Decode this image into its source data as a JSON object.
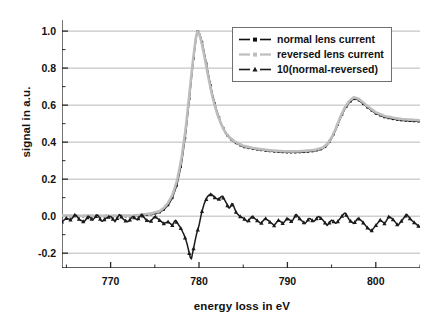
{
  "chart_data": {
    "type": "line",
    "title": "",
    "xlabel": "energy loss in eV",
    "ylabel": "signal in a.u.",
    "xlim": [
      764.5,
      805.0
    ],
    "ylim": [
      -0.28,
      1.06
    ],
    "xticks": [
      770,
      780,
      790,
      800
    ],
    "xticklabels": [
      "770",
      "780",
      "790",
      "800"
    ],
    "xminorticks": [
      765,
      775,
      785,
      795,
      805
    ],
    "yticks": [
      -0.2,
      0.0,
      0.2,
      0.4,
      0.6,
      0.8,
      1.0
    ],
    "yticklabels": [
      "-0.2",
      "0.0",
      "0.2",
      "0.4",
      "0.6",
      "0.8",
      "1.0"
    ],
    "grid": "horizontal",
    "grid_color": "#b8b8b8",
    "legend_position": "upper right",
    "series": [
      {
        "name": "normal lens current",
        "color": "#101010",
        "marker": "square",
        "linestyle": "dash-dot",
        "x": [
          764.5,
          765.5,
          766.5,
          767.5,
          768.5,
          769.5,
          770.5,
          771.5,
          772.5,
          773.5,
          774.5,
          775.5,
          776.0,
          776.5,
          777.0,
          777.5,
          778.0,
          778.5,
          779.0,
          779.3,
          779.6,
          779.8,
          780.0,
          780.3,
          780.6,
          781.0,
          781.5,
          782.0,
          782.5,
          783.0,
          783.5,
          784.0,
          785.0,
          786.0,
          787.0,
          788.0,
          789.0,
          790.0,
          791.0,
          792.0,
          793.0,
          794.0,
          794.5,
          795.0,
          795.5,
          796.0,
          796.5,
          797.0,
          797.5,
          798.0,
          798.5,
          799.0,
          800.0,
          801.0,
          802.0,
          803.0,
          804.0,
          805.0
        ],
        "y": [
          0.0,
          0.0,
          0.0,
          0.0,
          0.0,
          0.0,
          0.0,
          0.0,
          0.0,
          0.005,
          0.01,
          0.02,
          0.035,
          0.06,
          0.1,
          0.17,
          0.28,
          0.45,
          0.68,
          0.82,
          0.94,
          1.0,
          0.995,
          0.95,
          0.88,
          0.78,
          0.66,
          0.57,
          0.5,
          0.45,
          0.42,
          0.4,
          0.375,
          0.365,
          0.358,
          0.352,
          0.348,
          0.345,
          0.345,
          0.348,
          0.352,
          0.365,
          0.385,
          0.42,
          0.47,
          0.53,
          0.58,
          0.615,
          0.635,
          0.63,
          0.61,
          0.59,
          0.555,
          0.535,
          0.525,
          0.518,
          0.515,
          0.512
        ]
      },
      {
        "name": "reversed lens current",
        "color": "#bdbdbd",
        "marker": "square",
        "linestyle": "dash-dot",
        "x": [
          764.5,
          765.5,
          766.5,
          767.5,
          768.5,
          769.5,
          770.5,
          771.5,
          772.5,
          773.5,
          774.5,
          775.5,
          776.0,
          776.5,
          777.0,
          777.5,
          778.0,
          778.5,
          779.0,
          779.3,
          779.6,
          779.8,
          780.0,
          780.3,
          780.6,
          781.0,
          781.5,
          782.0,
          782.5,
          783.0,
          783.5,
          784.0,
          785.0,
          786.0,
          787.0,
          788.0,
          789.0,
          790.0,
          791.0,
          792.0,
          793.0,
          794.0,
          794.5,
          795.0,
          795.5,
          796.0,
          796.5,
          797.0,
          797.5,
          798.0,
          798.5,
          799.0,
          800.0,
          801.0,
          802.0,
          803.0,
          804.0,
          805.0
        ],
        "y": [
          0.003,
          0.003,
          0.002,
          0.003,
          0.002,
          0.003,
          0.002,
          0.003,
          0.002,
          0.008,
          0.014,
          0.026,
          0.043,
          0.072,
          0.115,
          0.19,
          0.305,
          0.475,
          0.7,
          0.835,
          0.948,
          1.002,
          0.99,
          0.938,
          0.866,
          0.765,
          0.648,
          0.562,
          0.497,
          0.451,
          0.424,
          0.404,
          0.38,
          0.369,
          0.362,
          0.356,
          0.352,
          0.35,
          0.35,
          0.353,
          0.357,
          0.37,
          0.39,
          0.425,
          0.477,
          0.537,
          0.588,
          0.623,
          0.642,
          0.636,
          0.617,
          0.596,
          0.561,
          0.541,
          0.531,
          0.524,
          0.521,
          0.518
        ]
      },
      {
        "name": "10(normal-reversed)",
        "color": "#1b1b1b",
        "marker": "triangle",
        "linestyle": "dash",
        "x": [
          764.5,
          765.0,
          765.5,
          766.0,
          766.5,
          767.0,
          767.5,
          768.0,
          768.5,
          769.0,
          769.5,
          770.0,
          770.5,
          771.0,
          771.5,
          772.0,
          772.5,
          773.0,
          773.5,
          774.0,
          774.5,
          775.0,
          775.5,
          776.0,
          776.5,
          777.0,
          777.3,
          777.6,
          778.0,
          778.3,
          778.6,
          778.9,
          779.1,
          779.4,
          779.7,
          780.0,
          780.3,
          780.6,
          781.0,
          781.4,
          781.8,
          782.2,
          782.6,
          783.0,
          783.4,
          783.8,
          784.2,
          784.6,
          785.0,
          785.5,
          786.0,
          786.5,
          787.0,
          787.5,
          788.0,
          788.5,
          789.0,
          789.5,
          790.0,
          790.5,
          791.0,
          791.5,
          792.0,
          792.5,
          793.0,
          793.5,
          794.0,
          794.5,
          795.0,
          795.5,
          796.0,
          796.5,
          797.0,
          797.5,
          798.0,
          798.5,
          799.0,
          799.5,
          800.0,
          800.5,
          801.0,
          801.5,
          802.0,
          802.5,
          803.0,
          803.5,
          804.0,
          804.5,
          805.0
        ],
        "y": [
          -0.03,
          -0.01,
          -0.02,
          0.01,
          -0.02,
          -0.03,
          0.0,
          -0.02,
          0.01,
          -0.03,
          -0.01,
          0.0,
          -0.03,
          0.01,
          -0.02,
          -0.03,
          0.0,
          -0.02,
          0.01,
          -0.02,
          -0.03,
          0.0,
          -0.02,
          -0.04,
          -0.03,
          -0.05,
          -0.02,
          -0.04,
          -0.07,
          -0.1,
          -0.14,
          -0.2,
          -0.24,
          -0.17,
          -0.1,
          -0.05,
          0.02,
          0.07,
          0.11,
          0.12,
          0.1,
          0.09,
          0.11,
          0.08,
          0.04,
          0.07,
          0.02,
          0.0,
          -0.01,
          -0.03,
          0.0,
          -0.02,
          -0.04,
          -0.01,
          -0.03,
          -0.05,
          -0.02,
          -0.04,
          -0.01,
          -0.03,
          0.01,
          -0.02,
          -0.04,
          -0.01,
          -0.03,
          0.0,
          -0.02,
          -0.05,
          -0.02,
          -0.04,
          -0.01,
          0.02,
          -0.02,
          -0.04,
          -0.01,
          -0.03,
          -0.06,
          -0.08,
          -0.05,
          -0.02,
          -0.04,
          0.0,
          -0.02,
          -0.05,
          -0.02,
          0.01,
          -0.02,
          -0.04,
          -0.06
        ]
      }
    ]
  }
}
